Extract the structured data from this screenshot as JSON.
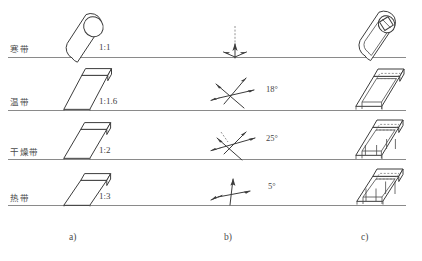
{
  "figure": {
    "caption_a": "a)",
    "caption_b": "b)",
    "caption_c": "c)"
  },
  "rows": [
    {
      "zone": "寒带",
      "ratio": "1:1",
      "angle": "",
      "form_a": "tilted-cylinder",
      "form_c": "hollow-cylinder"
    },
    {
      "zone": "温带",
      "ratio": "1:1.6",
      "angle": "18°",
      "form_a": "tilted-box",
      "form_c": "hollow-box"
    },
    {
      "zone": "干燥带",
      "ratio": "1:2",
      "angle": "25°",
      "form_a": "tilted-box",
      "form_c": "hollow-box"
    },
    {
      "zone": "热带",
      "ratio": "1:3",
      "angle": "5°",
      "form_a": "tilted-box",
      "form_c": "hollow-box"
    }
  ],
  "colors": {
    "background": "#ffffff",
    "stroke": "#3c3c3c",
    "baseline": "#8a8a8a",
    "text": "#3f3f3f"
  }
}
